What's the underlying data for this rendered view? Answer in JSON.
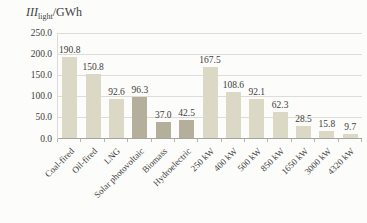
{
  "chart_title": {
    "symbol": "III",
    "subscript": "light",
    "unit": "/GWh"
  },
  "chart_data": {
    "type": "bar",
    "categories": [
      "Coal-fired",
      "Oil-fired",
      "LNG",
      "Solar photovoltaic",
      "Biomass",
      "Hydroelectric",
      "250 kW",
      "400 kW",
      "500 kW",
      "850 kW",
      "1650 kW",
      "3000 kW",
      "4320 kW"
    ],
    "values": [
      190.8,
      150.8,
      92.6,
      96.3,
      37.0,
      42.5,
      167.5,
      108.6,
      92.1,
      62.3,
      28.5,
      15.8,
      9.7
    ],
    "value_labels": [
      "190.8",
      "150.8",
      "92.6",
      "96.3",
      "37.0",
      "42.5",
      "167.5",
      "108.6",
      "92.1",
      "62.3",
      "28.5",
      "15.8",
      "9.7"
    ],
    "ylabel": "III_light/GWh",
    "xlabel": "",
    "ylim": [
      0,
      250
    ],
    "ytick_step": 50,
    "ytick_labels": [
      "0.0",
      "50.0",
      "100.0",
      "150.0",
      "200.0",
      "250.0"
    ],
    "grid": true,
    "legend": "none",
    "highlight_indices": [
      3,
      4,
      5
    ],
    "colors": {
      "bar_light": "#dcd8c6",
      "bar_dark": "#b4af9b",
      "text": "#3d3d3d",
      "gridline": "#dedcd6",
      "axis": "#a5a49e"
    }
  }
}
